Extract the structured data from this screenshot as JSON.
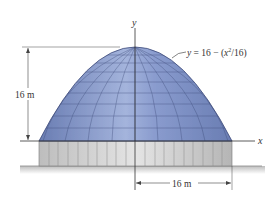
{
  "diagram": {
    "type": "parabolic dome",
    "axis_labels": {
      "x": "x",
      "y": "y"
    },
    "equation": "y = 16 − (x²/16)",
    "equation_parts": {
      "prefix": "y = 16 − (x",
      "sup": "2",
      "suffix": "/16)"
    },
    "height_dimension": "16 m",
    "half_width_dimension": "16 m",
    "colors": {
      "dome": "#6f83b8",
      "dome_light": "#9fb0d8",
      "grid": "#3d4a78",
      "base": "#cfcfcf",
      "ground": "#999999"
    }
  }
}
